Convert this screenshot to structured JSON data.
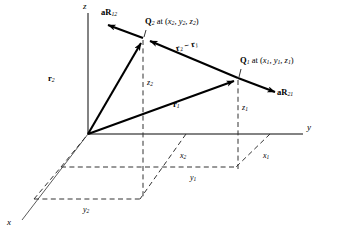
{
  "figure": {
    "type": "vector-diagram"
  },
  "axes": {
    "x_label": "x",
    "y_label": "y",
    "z_label": "z"
  },
  "points": {
    "q2": {
      "label": "Q",
      "label_sub": "2",
      "at_text": " at (",
      "coords": [
        {
          "sym": "x",
          "sub": "2"
        },
        {
          "sym": "y",
          "sub": "2"
        },
        {
          "sym": "z",
          "sub": "2"
        }
      ],
      "close_text": ")",
      "full_text": "Q2 at (x2, y2, z2)"
    },
    "q1": {
      "label": "Q",
      "label_sub": "1",
      "at_text": " at (",
      "coords": [
        {
          "sym": "x",
          "sub": "1"
        },
        {
          "sym": "y",
          "sub": "1"
        },
        {
          "sym": "z",
          "sub": "1"
        }
      ],
      "close_text": ")",
      "full_text": "Q1 at (x1, y1, z1)"
    }
  },
  "vectors": {
    "r2": {
      "sym": "r",
      "sub": "2"
    },
    "r1": {
      "sym": "r",
      "sub": "1"
    },
    "difference": {
      "part1_sym": "r",
      "part1_sub": "2",
      "operator": " − ",
      "part2_sym": "r",
      "part2_sub": "1"
    },
    "unit_a_r12": {
      "prefix": "a",
      "sym": "R",
      "sub": "12"
    },
    "unit_a_r21": {
      "prefix": "a",
      "sym": "R",
      "sub": "21"
    }
  },
  "projections": {
    "z2": {
      "sym": "z",
      "sub": "2"
    },
    "z1": {
      "sym": "z",
      "sub": "1"
    },
    "x2": {
      "sym": "x",
      "sub": "2"
    },
    "x1": {
      "sym": "x",
      "sub": "1"
    },
    "y2": {
      "sym": "y",
      "sub": "2"
    },
    "y1": {
      "sym": "y",
      "sub": "1"
    }
  },
  "colors": {
    "ink": "#000000",
    "axis": "#555555",
    "dashed": "#333333",
    "background": "#ffffff"
  },
  "geometry": {
    "origin": [
      88,
      134
    ],
    "q2_point": [
      143,
      38
    ],
    "q1_point": [
      238,
      78
    ],
    "y_axis_end": [
      305,
      134
    ],
    "z_axis_top": [
      88,
      12
    ],
    "x_axis_end": [
      20,
      222
    ]
  }
}
